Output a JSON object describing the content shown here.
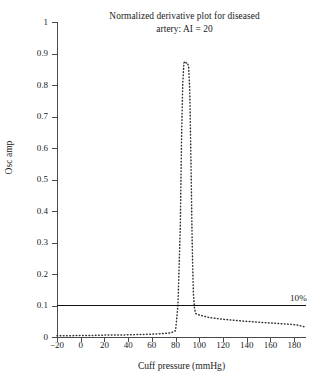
{
  "chart_data": {
    "type": "line",
    "title": "Normalized derivative plot for diseased artery: AI = 20",
    "title_line1": "Normalized derivative plot for diseased",
    "title_line2": "artery: AI = 20",
    "xlabel": "Cuff pressure (mmHg)",
    "ylabel": "Osc amp",
    "xlim": [
      -20,
      190
    ],
    "ylim": [
      0,
      1
    ],
    "xticks": [
      -20,
      0,
      20,
      40,
      60,
      80,
      100,
      120,
      140,
      160,
      180
    ],
    "xtick_labels": [
      "−20",
      "0",
      "20",
      "40",
      "60",
      "80",
      "100",
      "120",
      "140",
      "160",
      "180"
    ],
    "yticks": [
      0,
      0.1,
      0.2,
      0.3,
      0.4,
      0.5,
      0.6,
      0.7,
      0.8,
      0.9,
      1
    ],
    "ytick_labels": [
      "0",
      "0.1",
      "0.2",
      "0.3",
      "0.4",
      "0.5",
      "0.6",
      "0.7",
      "0.8",
      "0.9",
      "1"
    ],
    "grid": false,
    "legend": null,
    "annotations": [
      {
        "text": "10%",
        "x": 190,
        "y": 0.1,
        "kind": "threshold-line-label"
      }
    ],
    "series": [
      {
        "name": "Normalized derivative (osc amp)",
        "style": "dotted",
        "color": "#333333",
        "x": [
          -20,
          -10,
          0,
          10,
          20,
          30,
          40,
          50,
          60,
          70,
          76,
          80,
          82,
          84,
          85,
          86,
          87,
          88,
          89,
          90,
          91,
          92,
          93,
          94,
          95,
          96,
          97,
          98,
          100,
          104,
          108,
          112,
          118,
          124,
          130,
          138,
          146,
          154,
          162,
          170,
          178,
          184,
          188,
          190
        ],
        "y": [
          0.004,
          0.004,
          0.005,
          0.005,
          0.006,
          0.006,
          0.007,
          0.008,
          0.009,
          0.011,
          0.013,
          0.02,
          0.1,
          0.35,
          0.62,
          0.8,
          0.87,
          0.875,
          0.87,
          0.87,
          0.86,
          0.78,
          0.55,
          0.3,
          0.14,
          0.09,
          0.075,
          0.072,
          0.07,
          0.066,
          0.062,
          0.06,
          0.057,
          0.055,
          0.053,
          0.05,
          0.048,
          0.046,
          0.044,
          0.042,
          0.04,
          0.037,
          0.033,
          0.03
        ]
      },
      {
        "name": "10% threshold",
        "style": "solid",
        "color": "#111111",
        "x": [
          -20,
          190
        ],
        "y": [
          0.1,
          0.1
        ]
      }
    ]
  }
}
